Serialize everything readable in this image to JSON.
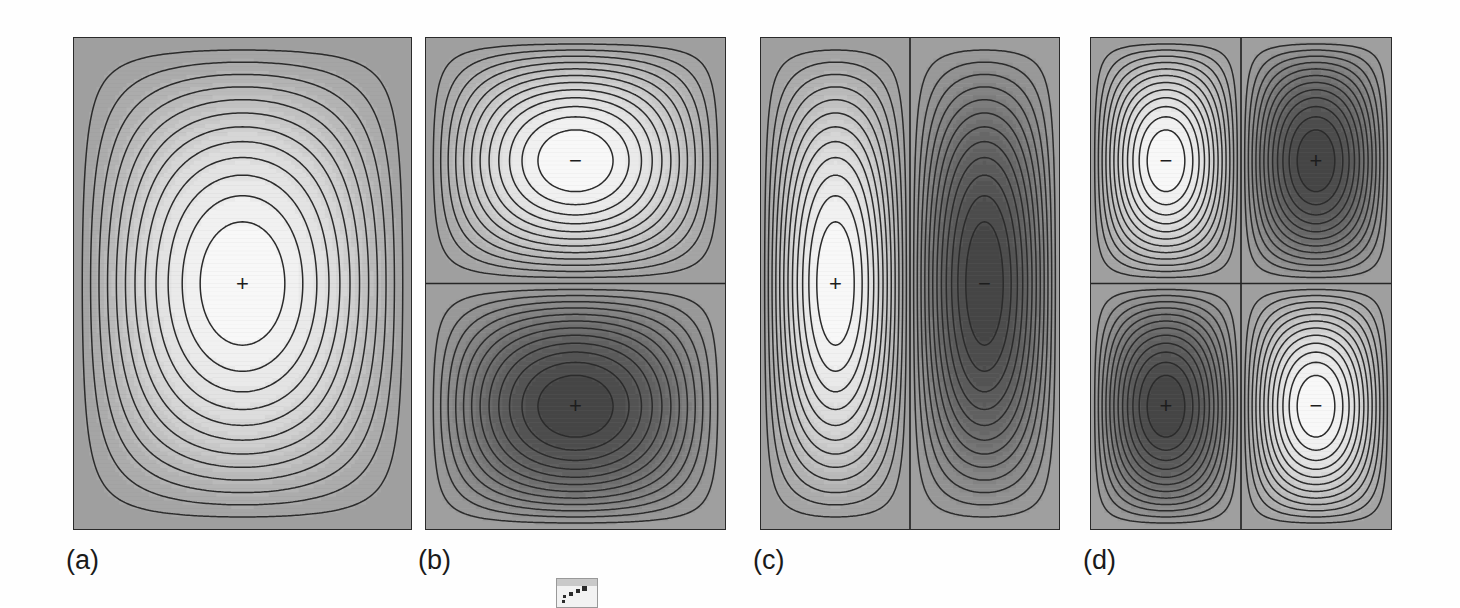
{
  "figure": {
    "kind": "contour-plot-grid",
    "panel_count": 4,
    "background_color": "#fefefe",
    "panel_border_color": "#2a2a2a",
    "field_mid_gray": "#aaaaaa",
    "positive_color": "#ffffff",
    "negative_color": "#4f4f4f",
    "contour_line_color": "#2b2b2b",
    "nodal_line_color": "#262626",
    "sign_positive": "+",
    "sign_negative": "−"
  },
  "panels": [
    {
      "id": "a",
      "label": "(a)",
      "nodes_horizontal": 0,
      "nodes_vertical": 0,
      "lobes": [
        {
          "sign": "+",
          "cx_frac": 0.5,
          "cy_frac": 0.5
        }
      ],
      "contour_levels": 12,
      "rect": {
        "x": 73,
        "y": 37,
        "w": 337,
        "h": 491
      },
      "label_pos": {
        "x": 66,
        "y": 545
      }
    },
    {
      "id": "b",
      "label": "(b)",
      "nodes_horizontal": 1,
      "nodes_vertical": 0,
      "lobes": [
        {
          "sign": "−",
          "cx_frac": 0.5,
          "cy_frac": 0.25
        },
        {
          "sign": "+",
          "cx_frac": 0.5,
          "cy_frac": 0.75
        }
      ],
      "contour_levels": 12,
      "rect": {
        "x": 425,
        "y": 37,
        "w": 299,
        "h": 491
      },
      "label_pos": {
        "x": 418,
        "y": 545
      }
    },
    {
      "id": "c",
      "label": "(c)",
      "nodes_horizontal": 0,
      "nodes_vertical": 1,
      "lobes": [
        {
          "sign": "+",
          "cx_frac": 0.25,
          "cy_frac": 0.5
        },
        {
          "sign": "−",
          "cx_frac": 0.75,
          "cy_frac": 0.5
        }
      ],
      "contour_levels": 12,
      "rect": {
        "x": 760,
        "y": 37,
        "w": 298,
        "h": 491
      },
      "label_pos": {
        "x": 753,
        "y": 545
      }
    },
    {
      "id": "d",
      "label": "(d)",
      "nodes_horizontal": 1,
      "nodes_vertical": 1,
      "lobes": [
        {
          "sign": "−",
          "cx_frac": 0.25,
          "cy_frac": 0.25
        },
        {
          "sign": "+",
          "cx_frac": 0.75,
          "cy_frac": 0.25
        },
        {
          "sign": "+",
          "cx_frac": 0.25,
          "cy_frac": 0.75
        },
        {
          "sign": "−",
          "cx_frac": 0.75,
          "cy_frac": 0.75
        }
      ],
      "contour_levels": 12,
      "rect": {
        "x": 1090,
        "y": 37,
        "w": 300,
        "h": 491
      },
      "label_pos": {
        "x": 1083,
        "y": 545
      }
    }
  ],
  "artifact": {
    "present": true,
    "description": "scan-fragment",
    "rect": {
      "x": 556,
      "y": 578,
      "w": 40,
      "h": 28
    }
  },
  "chart_data": {
    "type": "heatmap",
    "title": "",
    "subtitle": "",
    "xlabel": "",
    "ylabel": "",
    "grid": false,
    "legend": "none",
    "value_range": [
      -1,
      1
    ],
    "contour_interval": 0.08,
    "panels": [
      {
        "panel": "(a)",
        "mode_indices": [
          1,
          1
        ],
        "nodal_lines": 0,
        "extrema": [
          {
            "sign": "+",
            "x": 0.5,
            "y": 0.5,
            "value": 1.0
          }
        ]
      },
      {
        "panel": "(b)",
        "mode_indices": [
          1,
          2
        ],
        "nodal_lines": 1,
        "nodal_orientation": "horizontal",
        "extrema": [
          {
            "sign": "-",
            "x": 0.5,
            "y": 0.25,
            "value": -1.0
          },
          {
            "sign": "+",
            "x": 0.5,
            "y": 0.75,
            "value": 1.0
          }
        ]
      },
      {
        "panel": "(c)",
        "mode_indices": [
          2,
          1
        ],
        "nodal_lines": 1,
        "nodal_orientation": "vertical",
        "extrema": [
          {
            "sign": "+",
            "x": 0.25,
            "y": 0.5,
            "value": 1.0
          },
          {
            "sign": "-",
            "x": 0.75,
            "y": 0.5,
            "value": -1.0
          }
        ]
      },
      {
        "panel": "(d)",
        "mode_indices": [
          2,
          2
        ],
        "nodal_lines": 2,
        "nodal_orientation": "horizontal+vertical",
        "extrema": [
          {
            "sign": "-",
            "x": 0.25,
            "y": 0.25,
            "value": -1.0
          },
          {
            "sign": "+",
            "x": 0.75,
            "y": 0.25,
            "value": 1.0
          },
          {
            "sign": "+",
            "x": 0.25,
            "y": 0.75,
            "value": 1.0
          },
          {
            "sign": "-",
            "x": 0.75,
            "y": 0.75,
            "value": -1.0
          }
        ]
      }
    ]
  }
}
